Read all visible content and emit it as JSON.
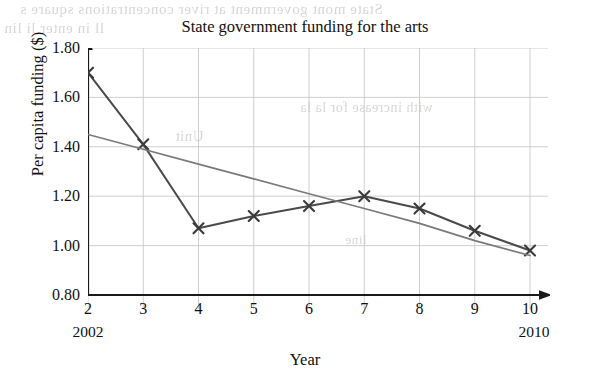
{
  "title": "State government funding for the arts",
  "axes": {
    "x_label": "Year",
    "y_label": "Per capita funding ($)",
    "x_start_year": "2002",
    "x_end_year": "2010"
  },
  "artifacts": {
    "bleed_1": "State mont government  at  river concentrations  square s",
    "bleed_2": "ll in enter  li  lin",
    "bleed_3": "with increase for la la",
    "bleed_4": "Unit",
    "bleed_5": "line"
  },
  "colors": {
    "background": "#ffffff",
    "axis": "#1a1a1a",
    "grid": "#c8c8c8",
    "data_line": "#4a4a4a",
    "trend_line": "#7a7a7a",
    "marker": "#3a3a3a",
    "text": "#111111",
    "bleed_text": "#b9b6b4"
  },
  "chart_data": {
    "type": "line",
    "title": "State government funding for the arts",
    "xlabel": "Year",
    "ylabel": "Per capita funding ($)",
    "xlim": [
      2,
      10
    ],
    "ylim": [
      0.8,
      1.8
    ],
    "xticks": [
      "2",
      "3",
      "4",
      "5",
      "6",
      "7",
      "8",
      "9",
      "10"
    ],
    "yticks": [
      "0.80",
      "1.00",
      "1.20",
      "1.40",
      "1.60",
      "1.80"
    ],
    "x": [
      2,
      3,
      4,
      5,
      6,
      7,
      8,
      9,
      10
    ],
    "grid": true,
    "legend": "none",
    "series": [
      {
        "name": "Per capita funding",
        "marker": "x",
        "values": [
          1.7,
          1.41,
          1.07,
          1.12,
          1.16,
          1.2,
          1.15,
          1.06,
          0.98
        ]
      },
      {
        "name": "Trend line",
        "marker": "none",
        "values": [
          1.45,
          1.39,
          1.33,
          1.27,
          1.21,
          1.15,
          1.09,
          1.02,
          0.96
        ]
      }
    ]
  }
}
